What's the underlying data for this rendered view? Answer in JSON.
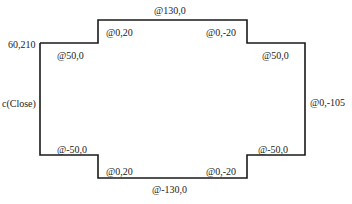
{
  "diagram": {
    "stroke_color": "#1a1a1a",
    "outline_points": [
      [
        40,
        43
      ],
      [
        98,
        43
      ],
      [
        98,
        20
      ],
      [
        247,
        20
      ],
      [
        247,
        43
      ],
      [
        305,
        43
      ],
      [
        305,
        155
      ],
      [
        247,
        155
      ],
      [
        247,
        178
      ],
      [
        98,
        178
      ],
      [
        98,
        155
      ],
      [
        40,
        155
      ],
      [
        40,
        43
      ]
    ],
    "labels": {
      "start_point": "60,210",
      "top_left_right": "@50,0",
      "top_left_up": "@0,20",
      "top": "@130,0",
      "top_right_down": "@0,-20",
      "top_right_right": "@50,0",
      "right_side": "@0,-105",
      "bottom_right_left": "@-50,0",
      "bottom_right_down": "@0,-20",
      "bottom": "@-130,0",
      "bottom_left_up": "@0,20",
      "bottom_left_left": "@-50,0",
      "close": "c(Close)"
    }
  }
}
